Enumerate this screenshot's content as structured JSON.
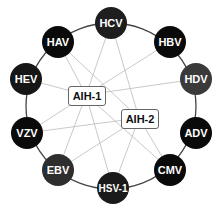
{
  "diagram": {
    "type": "network",
    "ring_color": "#444444",
    "edge_color": "#bbbbbb",
    "ring": {
      "cx": 111,
      "cy": 106,
      "rx": 85,
      "ry": 83
    },
    "viruses": [
      {
        "label": "HCV",
        "x": 111,
        "y": 23,
        "color": "#1e1e1e"
      },
      {
        "label": "HAV",
        "x": 58,
        "y": 42,
        "color": "#0a0a0a"
      },
      {
        "label": "HBV",
        "x": 170,
        "y": 42,
        "color": "#0a0a0a"
      },
      {
        "label": "HEV",
        "x": 26,
        "y": 79,
        "color": "#161616"
      },
      {
        "label": "HDV",
        "x": 196,
        "y": 79,
        "color": "#3a3a3a"
      },
      {
        "label": "VZV",
        "x": 27,
        "y": 133,
        "color": "#0a0a0a"
      },
      {
        "label": "ADV",
        "x": 196,
        "y": 133,
        "color": "#0a0a0a"
      },
      {
        "label": "EBV",
        "x": 58,
        "y": 170,
        "color": "#2e2e2e"
      },
      {
        "label": "CMV",
        "x": 170,
        "y": 170,
        "color": "#0a0a0a"
      },
      {
        "label": "HSV-1",
        "x": 113,
        "y": 188,
        "color": "#1a1a1a"
      }
    ],
    "diseases": [
      {
        "label": "AIH-1",
        "x": 68,
        "y": 86,
        "w": 36,
        "h": 18
      },
      {
        "label": "AIH-2",
        "x": 121,
        "y": 109,
        "w": 36,
        "h": 18
      }
    ],
    "edges": [
      [
        "HCV",
        "AIH-1"
      ],
      [
        "HCV",
        "AIH-2"
      ],
      [
        "HAV",
        "AIH-1"
      ],
      [
        "HAV",
        "AIH-2"
      ],
      [
        "HBV",
        "AIH-1"
      ],
      [
        "HEV",
        "AIH-1"
      ],
      [
        "HDV",
        "AIH-1"
      ],
      [
        "VZV",
        "AIH-1"
      ],
      [
        "VZV",
        "AIH-2"
      ],
      [
        "EBV",
        "AIH-1"
      ],
      [
        "EBV",
        "AIH-2"
      ],
      [
        "HSV-1",
        "AIH-1"
      ],
      [
        "HSV-1",
        "AIH-2"
      ],
      [
        "CMV",
        "AIH-2"
      ],
      [
        "AIH-1",
        "CMV"
      ]
    ]
  }
}
